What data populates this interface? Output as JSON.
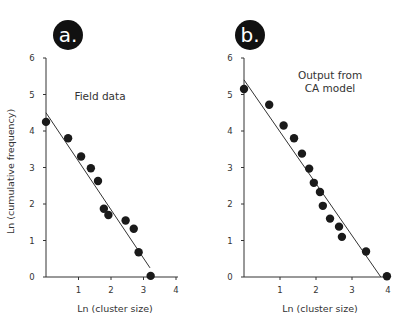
{
  "chart_data": [
    {
      "type": "scatter",
      "panel_label": "a.",
      "title": "Field data",
      "xlabel": "Ln (cluster size)",
      "ylabel": "Ln (cumulative frequency)",
      "xlim": [
        0,
        4
      ],
      "ylim": [
        0,
        6
      ],
      "xticks": [
        1,
        2,
        3,
        4
      ],
      "yticks": [
        0,
        1,
        2,
        3,
        4,
        5,
        6
      ],
      "grid": false,
      "series": [
        {
          "name": "Field data",
          "x": [
            0.0,
            0.68,
            1.08,
            1.38,
            1.6,
            1.78,
            1.92,
            2.45,
            2.7,
            2.85,
            3.22
          ],
          "y": [
            4.25,
            3.8,
            3.3,
            2.98,
            2.63,
            1.87,
            1.7,
            1.55,
            1.32,
            0.68,
            0.03
          ]
        }
      ],
      "fit_line": {
        "x": [
          0.0,
          3.2
        ],
        "y": [
          4.5,
          0.25
        ]
      }
    },
    {
      "type": "scatter",
      "panel_label": "b.",
      "title": "Output from CA model",
      "title_lines": [
        "Output from",
        "CA model"
      ],
      "xlabel": "Ln (cluster size)",
      "ylabel": "",
      "xlim": [
        0,
        4
      ],
      "ylim": [
        0,
        6
      ],
      "xticks": [
        1,
        2,
        3,
        4
      ],
      "yticks": [
        0,
        1,
        2,
        3,
        4,
        5,
        6
      ],
      "grid": false,
      "series": [
        {
          "name": "CA model",
          "x": [
            0.0,
            0.7,
            1.1,
            1.39,
            1.61,
            1.81,
            1.94,
            2.11,
            2.19,
            2.39,
            2.64,
            2.72,
            3.39,
            3.97
          ],
          "y": [
            5.15,
            4.72,
            4.15,
            3.8,
            3.38,
            2.97,
            2.58,
            2.33,
            1.95,
            1.6,
            1.38,
            1.1,
            0.7,
            0.02
          ]
        }
      ],
      "fit_line": {
        "x": [
          0.0,
          3.8
        ],
        "y": [
          5.4,
          0.0
        ]
      }
    }
  ],
  "colors": {
    "marker": "#1a1a1a",
    "axis": "#333333",
    "badge": "#111111"
  }
}
